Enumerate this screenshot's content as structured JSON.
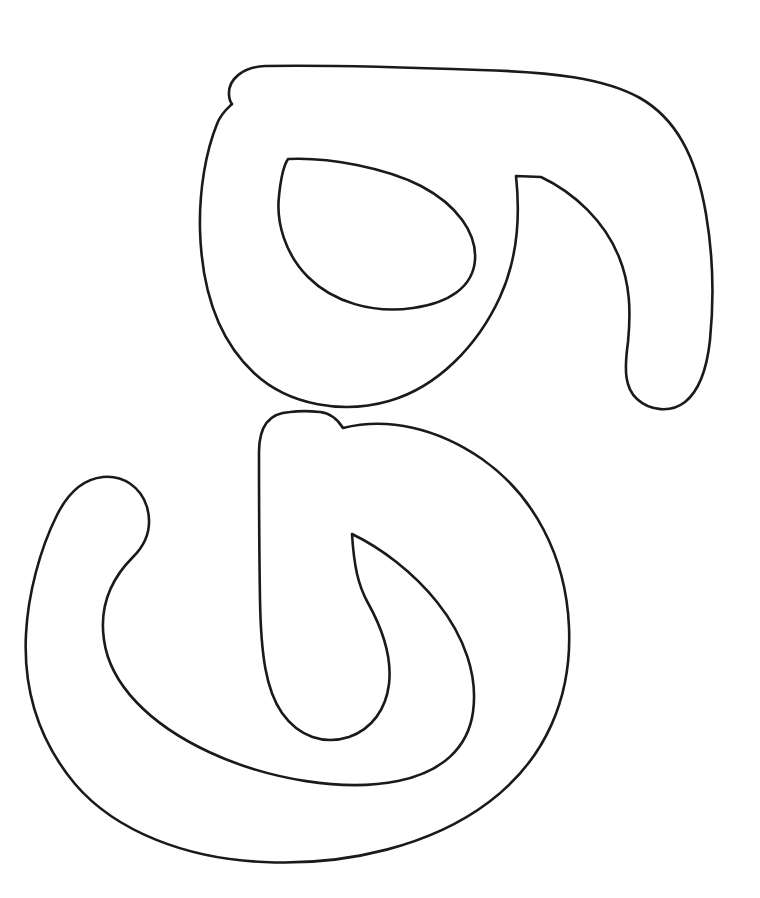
{
  "page": {
    "width": 760,
    "height": 898,
    "background_color": "#ffffff",
    "kind": "line-art-outline-drawing"
  },
  "artwork": {
    "name": "calligraphic-glyph-outline",
    "stroke_color": "#1a1a1a",
    "stroke_width": 2.6,
    "fill": "none",
    "description": "Black outline line-art of a two-part cursive glyph",
    "components": [
      {
        "id": "upper-glyph",
        "label": "upper-loop-with-tail",
        "outer_outline": "M 265 66 C 243 67 228 79 229 95 C 229.6 101 231 103 232 104 C 229 107 221 113 217 124 C 206 151 199 190 200 230 C 202 300 224 345 254 373 C 289 406 344 414 389 401 C 438 387 478 345 500 297 C 516 262 521 222 516 176 L 541 177 C 575 193 605 222 619 257 C 630 284 631 311 628 342 C 624 371 625 388 637 399 C 650 411 671 413 685 402 C 700 390 707 368 710 340 C 714 300 713 255 706 214 C 696 155 675 118 640 98 C 604 78 552 72 480 70 C 400 67 320 65 265 66 Z",
        "inner_counter": "M 288 159 C 329 157 386 168 421 186 C 457 205 477 233 475 260 C 473 287 449 303 413 308 C 373 314 333 302 308 277 C 285 254 276 222 279 196 C 281 176 284 165 288 159 Z",
        "cusps": [
          {
            "name": "top-left-notch",
            "x": 232,
            "y": 103
          },
          {
            "name": "tail-start-cusp",
            "x": 516,
            "y": 176
          },
          {
            "name": "counter-top-cusp",
            "x": 288,
            "y": 159
          }
        ],
        "extents": {
          "left": 200,
          "right": 712,
          "top": 65,
          "bottom": 411
        }
      },
      {
        "id": "lower-glyph",
        "label": "lower-loop-with-hook",
        "outer_outline": "M 290 412 C 266 413 259 430 259 452 C 259 478 259 540 260 600 C 261 655 266 690 282 713 C 299 737 324 745 349 737 C 372 729 386 709 389 684 C 392 658 383 630 368 603 C 358 585 354 566 352 534 C 381 548 413 572 437 602 C 465 637 478 676 473 712 C 468 748 442 772 398 781 C 345 792 269 780 209 752 C 149 724 110 684 104 640 C 99 606 112 578 133 557 C 148 542 152 525 147 507 C 141 487 123 475 103 477 C 84 479 68 493 57 515 C 40 549 28 594 26 634 C 23 692 40 742 75 784 C 116 832 188 859 264 862 C 348 866 432 845 489 802 C 546 759 572 697 569 627 C 566 555 533 495 482 459 C 437 428 388 417 343 428 C 338 420 330 413 320 412 C 310 411 298 411 290 412 Z",
        "inner_counter": null,
        "cusps": [
          {
            "name": "hook-top-cusp",
            "x": 343,
            "y": 428
          },
          {
            "name": "inner-loop-cusp",
            "x": 352,
            "y": 534
          }
        ],
        "extents": {
          "left": 26,
          "right": 571,
          "top": 410,
          "bottom": 866
        }
      }
    ]
  },
  "caption": {
    "alt_text": "Black and white line-art outline drawing of a cursive glyph"
  }
}
